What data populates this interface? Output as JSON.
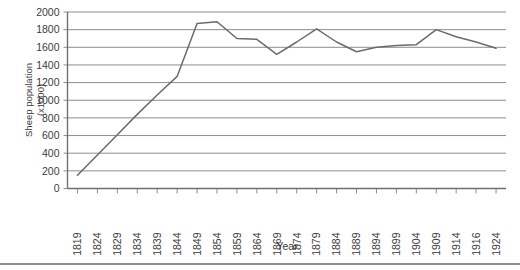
{
  "chart_data": {
    "type": "line",
    "title": "",
    "xlabel": "Year",
    "ylabel": "Sheep population (x1000)",
    "ylabel_line1": "Sheep population",
    "ylabel_line2": "(x1000)",
    "ylim": [
      0,
      2000
    ],
    "ytick_step": 200,
    "grid": true,
    "legend": "none",
    "yticks": [
      2000,
      1800,
      1600,
      1400,
      1200,
      1000,
      800,
      600,
      400,
      200,
      0
    ],
    "categories": [
      "1819",
      "1824",
      "1829",
      "1834",
      "1839",
      "1844",
      "1849",
      "1854",
      "1859",
      "1864",
      "1869",
      "1874",
      "1879",
      "1884",
      "1889",
      "1894",
      "1899",
      "1904",
      "1909",
      "1914",
      "1916",
      "1924"
    ],
    "values": [
      150,
      380,
      610,
      840,
      1060,
      1270,
      1870,
      1890,
      1700,
      1690,
      1520,
      1660,
      1810,
      1660,
      1550,
      1600,
      1620,
      1630,
      1800,
      1720,
      1660,
      1590
    ],
    "series": [
      {
        "name": "Sheep population",
        "color": "#6b6b6b",
        "values": [
          150,
          380,
          610,
          840,
          1060,
          1270,
          1870,
          1890,
          1700,
          1690,
          1520,
          1660,
          1810,
          1660,
          1550,
          1600,
          1620,
          1630,
          1800,
          1720,
          1660,
          1590
        ]
      }
    ]
  },
  "figure": {
    "axis_color": "#6f6f6f",
    "grid_color": "#8d8d8d",
    "line_color": "#6b6b6b",
    "background": "#ffffff"
  }
}
